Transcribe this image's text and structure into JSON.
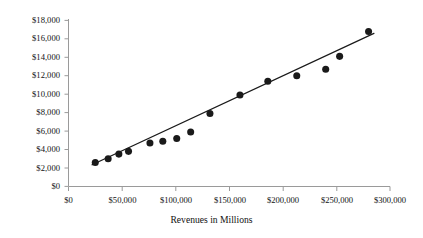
{
  "chart_data": {
    "type": "scatter",
    "title": "",
    "subtitle": "",
    "xlabel": "Revenues in Millions",
    "ylabel": "",
    "xlim": [
      0,
      300000
    ],
    "ylim": [
      0,
      18000
    ],
    "xticks": [
      0,
      50000,
      100000,
      150000,
      200000,
      250000,
      300000
    ],
    "yticks": [
      0,
      2000,
      4000,
      6000,
      8000,
      10000,
      12000,
      14000,
      16000,
      18000
    ],
    "xtick_labels": [
      "$0",
      "$50,000",
      "$100,000",
      "$150,000",
      "$200,000",
      "$250,000",
      "$300,000"
    ],
    "ytick_labels": [
      "$0",
      "$2,000",
      "$4,000",
      "$6,000",
      "$8,000",
      "$10,000",
      "$12,000",
      "$14,000",
      "$16,000",
      "$18,000"
    ],
    "grid": false,
    "legend": false,
    "legend_position": "none",
    "marker_color": "#1a1a1a",
    "marker_size": 4.4,
    "axis_color": "#808080",
    "trendline_color": "#1a1a1a",
    "series": [
      {
        "name": "Observations",
        "type": "scatter",
        "x": [
          25000,
          37000,
          47000,
          56000,
          76000,
          88000,
          101000,
          114000,
          132000,
          160000,
          186000,
          213000,
          240000,
          253000,
          280000
        ],
        "y": [
          2600,
          3000,
          3500,
          3800,
          4700,
          4900,
          5200,
          5900,
          7900,
          9900,
          11400,
          12000,
          12700,
          14100,
          16800
        ]
      },
      {
        "name": "Linear trendline",
        "type": "line",
        "x": [
          22000,
          285000
        ],
        "y": [
          2350,
          16600
        ]
      }
    ],
    "annotations": []
  }
}
